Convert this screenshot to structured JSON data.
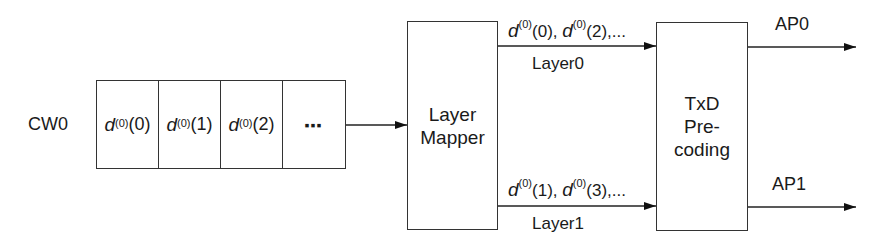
{
  "diagram": {
    "codeword": {
      "label": "CW0",
      "cells": [
        {
          "symbol": "d",
          "superscript": "(0)",
          "index": "(0)"
        },
        {
          "symbol": "d",
          "superscript": "(0)",
          "index": "(1)"
        },
        {
          "symbol": "d",
          "superscript": "(0)",
          "index": "(2)"
        }
      ],
      "ellipsis": "▪▪▪"
    },
    "layer_mapper": {
      "line1": "Layer",
      "line2": "Mapper"
    },
    "layers": [
      {
        "name": "Layer0",
        "sequence": {
          "a_sym": "d",
          "a_sup": "(0)",
          "a_idx": "(0)",
          "sep": ", ",
          "b_sym": "d",
          "b_sup": "(0)",
          "b_idx": "(2)",
          "tail": ",..."
        }
      },
      {
        "name": "Layer1",
        "sequence": {
          "a_sym": "d",
          "a_sup": "(0)",
          "a_idx": "(1)",
          "sep": ", ",
          "b_sym": "d",
          "b_sup": "(0)",
          "b_idx": "(3)",
          "tail": ",..."
        }
      }
    ],
    "precoder": {
      "line1": "TxD",
      "line2": "Pre-",
      "line3": "coding"
    },
    "outputs": [
      {
        "label": "AP0"
      },
      {
        "label": "AP1"
      }
    ]
  }
}
